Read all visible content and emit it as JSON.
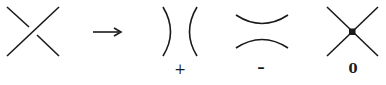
{
  "diagram": {
    "type": "knot-crossing-resolution",
    "figures": [
      {
        "id": "crossing",
        "description": "Knot crossing: overstrand bottom-left to top-right, understrand broken"
      },
      {
        "id": "arrow",
        "description": "Right arrow"
      },
      {
        "id": "positive-smoothing",
        "description": "Vertical smoothing )(",
        "label": "+"
      },
      {
        "id": "negative-smoothing",
        "description": "Horizontal smoothing",
        "label": "–"
      },
      {
        "id": "singular-crossing",
        "description": "Double point with dot at center",
        "label": "0"
      }
    ]
  },
  "labels": {
    "plus": "+",
    "minus": "–",
    "zero": "0"
  },
  "colors": {
    "ink": "#1a1a1a",
    "background": "#ffffff"
  }
}
